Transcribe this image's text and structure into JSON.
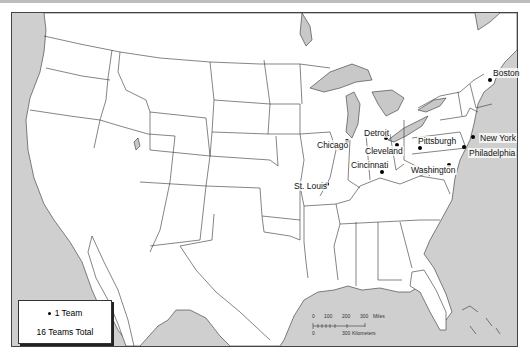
{
  "map": {
    "title": "",
    "colors": {
      "land": "#ffffff",
      "water": "#cfcfcf",
      "border": "#333333",
      "dot": "#000000"
    },
    "cities": [
      {
        "name": "Boston",
        "x": 490,
        "y": 80,
        "label_x": 492,
        "label_y": 68,
        "teams": 1
      },
      {
        "name": "New York",
        "x": 473,
        "y": 137,
        "label_x": 479,
        "label_y": 133,
        "teams": 1
      },
      {
        "name": "Philadelphia",
        "x": 464,
        "y": 147,
        "label_x": 468,
        "label_y": 148,
        "teams": 1
      },
      {
        "name": "Pittsburgh",
        "x": 420,
        "y": 148,
        "label_x": 417,
        "label_y": 136,
        "teams": 1
      },
      {
        "name": "Washington",
        "x": 449,
        "y": 165,
        "label_x": 410,
        "label_y": 165,
        "teams": 1
      },
      {
        "name": "Detroit",
        "x": 386,
        "y": 138,
        "label_x": 363,
        "label_y": 128,
        "teams": 1
      },
      {
        "name": "Cleveland",
        "x": 397,
        "y": 145,
        "label_x": 364,
        "label_y": 146,
        "teams": 1
      },
      {
        "name": "Chicago",
        "x": 347,
        "y": 141,
        "label_x": 316,
        "label_y": 140,
        "teams": 1
      },
      {
        "name": "Cincinnati",
        "x": 382,
        "y": 172,
        "label_x": 350,
        "label_y": 160,
        "teams": 1
      },
      {
        "name": "St. Louis",
        "x": 327,
        "y": 184,
        "label_x": 293,
        "label_y": 181,
        "teams": 1
      }
    ]
  },
  "legend": {
    "symbol_label": "1 Team",
    "total_label": "16 Teams Total"
  },
  "scale_bar": {
    "miles_ticks": [
      "0",
      "100",
      "200",
      "300"
    ],
    "miles_unit": "Miles",
    "km_ticks": [
      "0",
      "300"
    ],
    "km_unit": "Kilometers"
  }
}
